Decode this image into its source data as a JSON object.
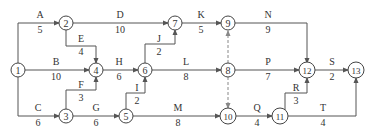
{
  "diagram": {
    "type": "activity-on-arrow network",
    "nodes": [
      {
        "id": "1",
        "x": 18,
        "y": 70
      },
      {
        "id": "2",
        "x": 66,
        "y": 23
      },
      {
        "id": "3",
        "x": 66,
        "y": 116
      },
      {
        "id": "4",
        "x": 96,
        "y": 70
      },
      {
        "id": "5",
        "x": 126,
        "y": 116
      },
      {
        "id": "6",
        "x": 145,
        "y": 70
      },
      {
        "id": "7",
        "x": 175,
        "y": 23
      },
      {
        "id": "8",
        "x": 228,
        "y": 70
      },
      {
        "id": "9",
        "x": 228,
        "y": 23
      },
      {
        "id": "10",
        "x": 228,
        "y": 116
      },
      {
        "id": "11",
        "x": 280,
        "y": 116
      },
      {
        "id": "12",
        "x": 307,
        "y": 70
      },
      {
        "id": "13",
        "x": 356,
        "y": 70
      }
    ],
    "activities": [
      {
        "name": "A",
        "duration": "5",
        "from": "1",
        "to": "2"
      },
      {
        "name": "B",
        "duration": "10",
        "from": "1",
        "to": "4"
      },
      {
        "name": "C",
        "duration": "6",
        "from": "1",
        "to": "3"
      },
      {
        "name": "D",
        "duration": "10",
        "from": "2",
        "to": "7"
      },
      {
        "name": "E",
        "duration": "4",
        "from": "2",
        "to": "4"
      },
      {
        "name": "F",
        "duration": "3",
        "from": "3",
        "to": "4"
      },
      {
        "name": "G",
        "duration": "6",
        "from": "3",
        "to": "5"
      },
      {
        "name": "H",
        "duration": "6",
        "from": "4",
        "to": "6"
      },
      {
        "name": "I",
        "duration": "2",
        "from": "5",
        "to": "6"
      },
      {
        "name": "J",
        "duration": "2",
        "from": "6",
        "to": "7"
      },
      {
        "name": "K",
        "duration": "5",
        "from": "7",
        "to": "9"
      },
      {
        "name": "L",
        "duration": "8",
        "from": "6",
        "to": "8"
      },
      {
        "name": "M",
        "duration": "8",
        "from": "5",
        "to": "10"
      },
      {
        "name": "N",
        "duration": "9",
        "from": "9",
        "to": "12"
      },
      {
        "name": "P",
        "duration": "7",
        "from": "8",
        "to": "12"
      },
      {
        "name": "Q",
        "duration": "4",
        "from": "10",
        "to": "11"
      },
      {
        "name": "R",
        "duration": "3",
        "from": "11",
        "to": "12"
      },
      {
        "name": "S",
        "duration": "2",
        "from": "12",
        "to": "13"
      },
      {
        "name": "T",
        "duration": "4",
        "from": "11",
        "to": "13"
      }
    ],
    "dummies": [
      {
        "from": "8",
        "to": "9"
      },
      {
        "from": "8",
        "to": "10"
      }
    ]
  },
  "labels": {
    "A": "A",
    "A_d": "5",
    "B": "B",
    "B_d": "10",
    "C": "C",
    "C_d": "6",
    "D": "D",
    "D_d": "10",
    "E": "E",
    "E_d": "4",
    "F": "F",
    "F_d": "3",
    "G": "G",
    "G_d": "6",
    "H": "H",
    "H_d": "6",
    "I": "I",
    "I_d": "2",
    "J": "J",
    "J_d": "2",
    "K": "K",
    "K_d": "5",
    "L": "L",
    "L_d": "8",
    "M": "M",
    "M_d": "8",
    "N": "N",
    "N_d": "9",
    "P": "P",
    "P_d": "7",
    "Q": "Q",
    "Q_d": "4",
    "R": "R",
    "R_d": "3",
    "S": "S",
    "S_d": "2",
    "T": "T",
    "T_d": "4",
    "n1": "1",
    "n2": "2",
    "n3": "3",
    "n4": "4",
    "n5": "5",
    "n6": "6",
    "n7": "7",
    "n8": "8",
    "n9": "9",
    "n10": "10",
    "n11": "11",
    "n12": "12",
    "n13": "13"
  }
}
